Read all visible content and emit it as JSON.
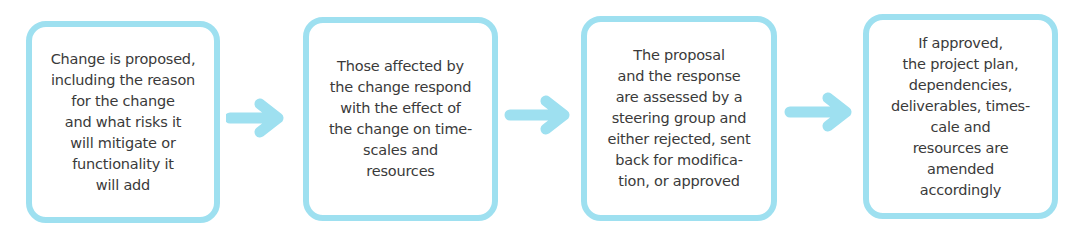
{
  "diagram": {
    "type": "process-flow",
    "accent_color": "#9ee0f0",
    "text_color": "#3a3a3a",
    "steps": [
      {
        "lines": [
          "Change is proposed,",
          "including the reason",
          "for the change",
          "and what risks it",
          "will mitigate or",
          "functionality it",
          "will add"
        ]
      },
      {
        "lines": [
          "Those affected by",
          "the change respond",
          "with the effect of",
          "the change on time-",
          "scales and",
          "resources"
        ]
      },
      {
        "lines": [
          "The proposal",
          "and the response",
          "are assessed by a",
          "steering group and",
          "either rejected, sent",
          "back for modifica-",
          "tion, or approved"
        ]
      },
      {
        "lines": [
          "If approved,",
          "the project plan,",
          "dependencies,",
          "deliverables, times-",
          "cale and",
          "resources are",
          "amended",
          "accordingly"
        ]
      }
    ],
    "connectors": [
      {
        "icon": "arrow-right-icon"
      },
      {
        "icon": "arrow-right-icon"
      },
      {
        "icon": "arrow-right-icon"
      }
    ]
  }
}
